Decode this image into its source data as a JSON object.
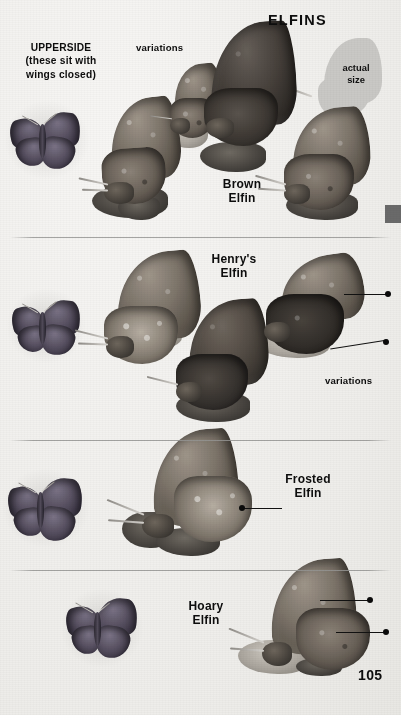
{
  "page": {
    "title": "ELFINS",
    "page_number": "105",
    "background_color": "#f3f2f0",
    "text_color": "#0d0d0d",
    "rule_color": "#969694"
  },
  "captions": {
    "upperside": "UPPERSIDE\n(these sit with\nwings closed)",
    "actual_size": "actual\nsize",
    "variations_top": "variations",
    "variations_henrys": "variations"
  },
  "species": [
    {
      "name": "Brown\nElfin",
      "label_id": "brown-elfin"
    },
    {
      "name": "Henry's\nElfin",
      "label_id": "henrys-elfin"
    },
    {
      "name": "Frosted\nElfin",
      "label_id": "frosted-elfin"
    },
    {
      "name": "Hoary\nElfin",
      "label_id": "hoary-elfin"
    }
  ],
  "markers": {
    "edge_tab_color": "#6a6a6a"
  }
}
